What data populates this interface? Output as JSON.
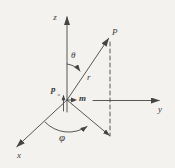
{
  "figure": {
    "background_color": "#f3f2ee",
    "line_color": "#454543",
    "text_color": "#3b3b39",
    "labels": {
      "z_axis": "z",
      "y_axis": "y",
      "x_axis": "x",
      "point": "P",
      "radial_line": "r",
      "polar_angle": "θ",
      "azimuth_angle": "φ",
      "dipole_p": "p",
      "dipole_p_sub": "o",
      "dipole_m": "m"
    }
  }
}
